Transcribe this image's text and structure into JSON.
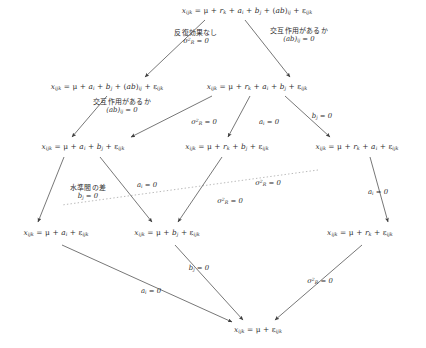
{
  "diagram": {
    "type": "lattice-flow-diagram",
    "colors": {
      "background": "#ffffff",
      "text": "#2e2e2e",
      "edge": "#4a4a4a",
      "dotted_edge": "#8a8a8a"
    },
    "nodes": [
      {
        "id": "n0",
        "name": "full-model",
        "x": 247,
        "y": 11,
        "text": "x",
        "html": "<span class=\"var\">x</span><sub>ijk</sub> = μ + <span class=\"var\">r</span><sub>k</sub> + <span class=\"var\">a</span><sub>i</sub> + <span class=\"var\">b</span><sub>j</sub> + (<span class=\"var\">ab</span>)<sub>ij</sub> + ε<sub>ijk</sub>",
        "plain": "x_ijk = μ + r_k + a_i + b_j + (ab)_ij + ε_ijk"
      },
      {
        "id": "n1",
        "name": "model-no-repeat",
        "x": 107,
        "y": 87,
        "html": "<span class=\"var\">x</span><sub>ijk</sub> = μ + <span class=\"var\">a</span><sub>i</sub> + <span class=\"var\">b</span><sub>j</sub> + (<span class=\"var\">ab</span>)<sub>ij</sub> + ε<sub>ijk</sub>",
        "plain": "x_ijk = μ + a_i + b_j + (ab)_ij + ε_ijk"
      },
      {
        "id": "n2",
        "name": "model-no-interaction",
        "x": 257,
        "y": 87,
        "html": "<span class=\"var\">x</span><sub>ijk</sub> = μ + <span class=\"var\">r</span><sub>k</sub> + <span class=\"var\">a</span><sub>i</sub> + <span class=\"var\">b</span><sub>j</sub> + ε<sub>ijk</sub>",
        "plain": "x_ijk = μ + r_k + a_i + b_j + ε_ijk"
      },
      {
        "id": "n3",
        "name": "model-ab-only",
        "x": 83,
        "y": 147,
        "html": "<span class=\"var\">x</span><sub>ijk</sub> = μ + <span class=\"var\">a</span><sub>i</sub> + <span class=\"var\">b</span><sub>j</sub> + ε<sub>ijk</sub>",
        "plain": "x_ijk = μ + a_i + b_j + ε_ijk"
      },
      {
        "id": "n4",
        "name": "model-rb",
        "x": 227,
        "y": 147,
        "html": "<span class=\"var\">x</span><sub>ijk</sub> = μ + <span class=\"var\">r</span><sub>k</sub> + <span class=\"var\">b</span><sub>j</sub> + ε<sub>ijk</sub>",
        "plain": "x_ijk = μ + r_k + b_j + ε_ijk"
      },
      {
        "id": "n5",
        "name": "model-ra",
        "x": 357,
        "y": 147,
        "html": "<span class=\"var\">x</span><sub>ijk</sub> = μ + <span class=\"var\">r</span><sub>k</sub> + <span class=\"var\">a</span><sub>i</sub> + ε<sub>ijk</sub>",
        "plain": "x_ijk = μ + r_k + a_i + ε_ijk"
      },
      {
        "id": "n6",
        "name": "model-a-only",
        "x": 56,
        "y": 233,
        "html": "<span class=\"var\">x</span><sub>ijk</sub> = μ + <span class=\"var\">a</span><sub>i</sub> + ε<sub>ijk</sub>",
        "plain": "x_ijk = μ + a_i + ε_ijk"
      },
      {
        "id": "n7",
        "name": "model-b-only",
        "x": 167,
        "y": 233,
        "html": "<span class=\"var\">x</span><sub>ijk</sub> = μ + <span class=\"var\">b</span><sub>j</sub> + ε<sub>ijk</sub>",
        "plain": "x_ijk = μ + b_j + ε_ijk"
      },
      {
        "id": "n8",
        "name": "model-r-only",
        "x": 360,
        "y": 233,
        "html": "<span class=\"var\">x</span><sub>ijk</sub> = μ + <span class=\"var\">r</span><sub>k</sub> + ε<sub>ijk</sub>",
        "plain": "x_ijk = μ + r_k + ε_ijk"
      },
      {
        "id": "n9",
        "name": "model-null",
        "x": 258,
        "y": 330,
        "html": "<span class=\"var\">x</span><sub>ijk</sub> = μ + ε<sub>ijk</sub>",
        "plain": "x_ijk = μ + ε_ijk"
      }
    ],
    "edges": [
      {
        "id": "e0",
        "name": "edge-full-to-norepeat",
        "from": "n0",
        "to": "n1",
        "x1": 205,
        "y1": 20,
        "x2": 145,
        "y2": 77,
        "style": "solid"
      },
      {
        "id": "e1",
        "name": "edge-full-to-nointeraction",
        "from": "n0",
        "to": "n2",
        "x1": 245,
        "y1": 20,
        "x2": 290,
        "y2": 77,
        "style": "solid"
      },
      {
        "id": "e2",
        "name": "edge-norepeat-to-ab",
        "from": "n1",
        "to": "n3",
        "x1": 107,
        "y1": 96,
        "x2": 72,
        "y2": 137,
        "style": "solid"
      },
      {
        "id": "e3",
        "name": "edge-nointeraction-to-ab",
        "from": "n2",
        "to": "n3",
        "x1": 212,
        "y1": 96,
        "x2": 131,
        "y2": 137,
        "style": "solid"
      },
      {
        "id": "e4",
        "name": "edge-nointeraction-to-rb",
        "from": "n2",
        "to": "n4",
        "x1": 250,
        "y1": 96,
        "x2": 228,
        "y2": 137,
        "style": "solid"
      },
      {
        "id": "e5",
        "name": "edge-nointeraction-to-ra",
        "from": "n2",
        "to": "n5",
        "x1": 285,
        "y1": 96,
        "x2": 330,
        "y2": 137,
        "style": "solid"
      },
      {
        "id": "e6",
        "name": "edge-ab-to-a",
        "from": "n3",
        "to": "n6",
        "x1": 64,
        "y1": 157,
        "x2": 38,
        "y2": 222,
        "style": "solid"
      },
      {
        "id": "e7",
        "name": "edge-ab-to-b",
        "from": "n3",
        "to": "n7",
        "x1": 100,
        "y1": 157,
        "x2": 152,
        "y2": 222,
        "style": "solid"
      },
      {
        "id": "e8",
        "name": "edge-ra-to-a-dotted",
        "from": "n5",
        "to": "n6",
        "x1": 318,
        "y1": 170,
        "x2": 62,
        "y2": 205,
        "style": "dotted"
      },
      {
        "id": "e9",
        "name": "edge-rb-to-b",
        "from": "n4",
        "to": "n7",
        "x1": 222,
        "y1": 157,
        "x2": 178,
        "y2": 222,
        "style": "solid"
      },
      {
        "id": "e10",
        "name": "edge-ra-to-r",
        "from": "n5",
        "to": "n8",
        "x1": 370,
        "y1": 157,
        "x2": 388,
        "y2": 222,
        "style": "solid"
      },
      {
        "id": "e11",
        "name": "edge-a-to-null",
        "from": "n6",
        "to": "n9",
        "x1": 62,
        "y1": 245,
        "x2": 232,
        "y2": 322,
        "style": "solid"
      },
      {
        "id": "e12",
        "name": "edge-b-to-null",
        "from": "n7",
        "to": "n9",
        "x1": 175,
        "y1": 245,
        "x2": 243,
        "y2": 320,
        "style": "solid"
      },
      {
        "id": "e13",
        "name": "edge-r-to-null",
        "from": "n8",
        "to": "n9",
        "x1": 362,
        "y1": 245,
        "x2": 275,
        "y2": 320,
        "style": "solid"
      }
    ],
    "edge_labels": [
      {
        "id": "l0",
        "name": "label-no-repeat-effect",
        "x": 196,
        "y": 38,
        "lines": [
          {
            "kind": "jp",
            "text": "反復効果なし"
          },
          {
            "kind": "math",
            "html": "σ<sup>2</sup><sub>R</sub> = 0",
            "plain": "σ²_R = 0"
          }
        ]
      },
      {
        "id": "l1",
        "name": "label-has-interaction",
        "x": 299,
        "y": 36,
        "lines": [
          {
            "kind": "jp",
            "text": "交互作用があるか"
          },
          {
            "kind": "math",
            "html": "(<span class=\"var\">ab</span>)<sub>ij</sub> = 0",
            "plain": "(ab)_ij = 0"
          }
        ]
      },
      {
        "id": "l2",
        "name": "label-has-interaction-2",
        "x": 122,
        "y": 107,
        "lines": [
          {
            "kind": "jp",
            "text": "交互作用があるか"
          },
          {
            "kind": "math",
            "html": "(<span class=\"var\">ab</span>)<sub>ij</sub> = 0",
            "plain": "(ab)_ij = 0"
          }
        ]
      },
      {
        "id": "l3",
        "name": "label-sigma-r-zero-a",
        "x": 204,
        "y": 122,
        "lines": [
          {
            "kind": "math",
            "html": "σ<sup>2</sup><sub>R</sub> = 0",
            "plain": "σ²_R = 0"
          }
        ]
      },
      {
        "id": "l4",
        "name": "label-a-zero-a",
        "x": 269,
        "y": 122,
        "lines": [
          {
            "kind": "math",
            "html": "<span class=\"var\">a</span><sub>i</sub> = 0",
            "plain": "a_i = 0"
          }
        ]
      },
      {
        "id": "l5",
        "name": "label-b-zero-a",
        "x": 322,
        "y": 116,
        "lines": [
          {
            "kind": "math",
            "html": "<span class=\"var\">b</span><sub>j</sub> = 0",
            "plain": "b_j = 0"
          }
        ]
      },
      {
        "id": "l6",
        "name": "label-level-difference",
        "x": 88,
        "y": 193,
        "lines": [
          {
            "kind": "jp",
            "text": "水準間の差"
          },
          {
            "kind": "math",
            "html": "<span class=\"var\">b</span><sub>j</sub> = 0",
            "plain": "b_j = 0"
          }
        ]
      },
      {
        "id": "l7",
        "name": "label-a-zero-b",
        "x": 147,
        "y": 185,
        "lines": [
          {
            "kind": "math",
            "html": "<span class=\"var\">a</span><sub>i</sub> = 0",
            "plain": "a_i = 0"
          }
        ]
      },
      {
        "id": "l8",
        "name": "label-sigma-r-zero-dotted",
        "x": 268,
        "y": 183,
        "lines": [
          {
            "kind": "math",
            "html": "σ<sup>2</sup><sub>R</sub> = 0",
            "plain": "σ²_R = 0"
          }
        ]
      },
      {
        "id": "l9",
        "name": "label-sigma-r-zero-b",
        "x": 230,
        "y": 201,
        "lines": [
          {
            "kind": "math",
            "html": "σ<sup>2</sup><sub>R</sub> = 0",
            "plain": "σ²_R = 0"
          }
        ]
      },
      {
        "id": "l10",
        "name": "label-a-zero-c",
        "x": 378,
        "y": 192,
        "lines": [
          {
            "kind": "math",
            "html": "<span class=\"var\">a</span><sub>i</sub> = 0",
            "plain": "a_i = 0"
          }
        ]
      },
      {
        "id": "l11",
        "name": "label-b-zero-b",
        "x": 199,
        "y": 268,
        "lines": [
          {
            "kind": "math",
            "html": "<span class=\"var\">b</span><sub>j</sub> = 0",
            "plain": "b_j = 0"
          }
        ]
      },
      {
        "id": "l12",
        "name": "label-a-zero-d",
        "x": 151,
        "y": 291,
        "lines": [
          {
            "kind": "math",
            "html": "<span class=\"var\">a</span><sub>i</sub> = 0",
            "plain": "a_i = 0"
          }
        ]
      },
      {
        "id": "l13",
        "name": "label-sigma-r-zero-c",
        "x": 320,
        "y": 281,
        "lines": [
          {
            "kind": "math",
            "html": "σ<sup>2</sup><sub>R</sub> = 0",
            "plain": "σ²_R = 0"
          }
        ]
      }
    ]
  }
}
